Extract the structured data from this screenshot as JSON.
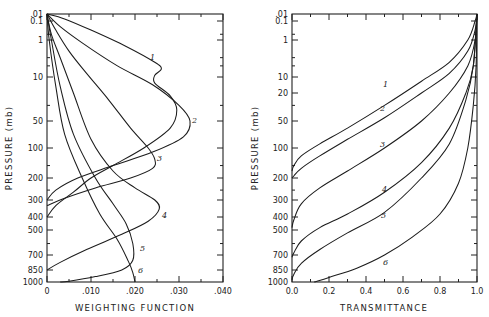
{
  "chart_data": [
    {
      "type": "line",
      "title": "",
      "xlabel": "WEIGHTING FUNCTION",
      "ylabel": "PRESSURE (mb)",
      "xlim": [
        0,
        0.04
      ],
      "ylim": [
        1000,
        0.01
      ],
      "xticks": [
        "0",
        ".010",
        ".020",
        ".030",
        ".040"
      ],
      "yticks": [
        ".01",
        "0.1",
        "1",
        "10",
        "50",
        "100",
        "200",
        "300",
        "400",
        "500",
        "700",
        "850",
        "1000"
      ],
      "grid": false,
      "series": [
        {
          "name": "1",
          "points": [
            [
              0,
              0.01
            ],
            [
              0.004,
              0.05
            ],
            [
              0.01,
              0.3
            ],
            [
              0.018,
              1.5
            ],
            [
              0.0245,
              4
            ],
            [
              0.026,
              6
            ],
            [
              0.0245,
              9
            ],
            [
              0.0245,
              13
            ],
            [
              0.028,
              22
            ],
            [
              0.0295,
              35
            ],
            [
              0.028,
              60
            ],
            [
              0.022,
              100
            ],
            [
              0.015,
              150
            ],
            [
              0.01,
              200
            ],
            [
              0.006,
              260
            ],
            [
              0.002,
              330
            ],
            [
              0,
              400
            ]
          ]
        },
        {
          "name": "2",
          "points": [
            [
              0,
              0.01
            ],
            [
              0.003,
              0.2
            ],
            [
              0.008,
              1.2
            ],
            [
              0.016,
              5
            ],
            [
              0.024,
              14
            ],
            [
              0.03,
              30
            ],
            [
              0.0325,
              50
            ],
            [
              0.031,
              75
            ],
            [
              0.024,
              110
            ],
            [
              0.015,
              150
            ],
            [
              0.007,
              200
            ],
            [
              0.002,
              250
            ],
            [
              0,
              300
            ]
          ]
        },
        {
          "name": "3",
          "points": [
            [
              0,
              0.01
            ],
            [
              0.002,
              0.3
            ],
            [
              0.005,
              2
            ],
            [
              0.009,
              8
            ],
            [
              0.014,
              25
            ],
            [
              0.019,
              60
            ],
            [
              0.023,
              100
            ],
            [
              0.0245,
              130
            ],
            [
              0.024,
              160
            ],
            [
              0.019,
              200
            ],
            [
              0.011,
              240
            ],
            [
              0.004,
              290
            ],
            [
              0,
              330
            ]
          ]
        },
        {
          "name": "4",
          "points": [
            [
              0,
              0.01
            ],
            [
              0.001,
              0.5
            ],
            [
              0.003,
              3
            ],
            [
              0.006,
              20
            ],
            [
              0.01,
              80
            ],
            [
              0.015,
              170
            ],
            [
              0.02,
              240
            ],
            [
              0.0245,
              300
            ],
            [
              0.0255,
              350
            ],
            [
              0.023,
              430
            ],
            [
              0.017,
              530
            ],
            [
              0.009,
              650
            ],
            [
              0.003,
              770
            ],
            [
              0,
              850
            ]
          ]
        },
        {
          "name": "5",
          "points": [
            [
              0,
              0.01
            ],
            [
              0.001,
              1
            ],
            [
              0.003,
              15
            ],
            [
              0.006,
              70
            ],
            [
              0.011,
              200
            ],
            [
              0.015,
              320
            ],
            [
              0.018,
              450
            ],
            [
              0.0195,
              600
            ],
            [
              0.0195,
              750
            ],
            [
              0.017,
              850
            ],
            [
              0.011,
              930
            ],
            [
              0.005,
              990
            ],
            [
              0.003,
              1000
            ]
          ]
        },
        {
          "name": "6",
          "points": [
            [
              0,
              0.01
            ],
            [
              0.0005,
              1
            ],
            [
              0.002,
              15
            ],
            [
              0.004,
              70
            ],
            [
              0.008,
              200
            ],
            [
              0.012,
              380
            ],
            [
              0.016,
              570
            ],
            [
              0.0185,
              760
            ],
            [
              0.0195,
              880
            ],
            [
              0.02,
              1000
            ]
          ]
        }
      ]
    },
    {
      "type": "line",
      "title": "",
      "xlabel": "TRANSMITTANCE",
      "ylabel": "PRESSURE (mb)",
      "xlim": [
        0.0,
        1.0
      ],
      "ylim": [
        1000,
        0.01
      ],
      "xticks": [
        "0.0",
        "0.2",
        "0.4",
        "0.6",
        "0.8",
        "1.0"
      ],
      "yticks": [
        ".01",
        "0.1",
        "1",
        "10",
        "20",
        "50",
        "100",
        "200",
        "300",
        "400",
        "500",
        "700",
        "850",
        "1000"
      ],
      "grid": false,
      "series": [
        {
          "name": "1",
          "points": [
            [
              1.0,
              0.01
            ],
            [
              0.99,
              0.1
            ],
            [
              0.95,
              1
            ],
            [
              0.85,
              4
            ],
            [
              0.7,
              12
            ],
            [
              0.5,
              30
            ],
            [
              0.3,
              60
            ],
            [
              0.15,
              90
            ],
            [
              0.05,
              120
            ],
            [
              0.01,
              150
            ],
            [
              0.0,
              170
            ]
          ]
        },
        {
          "name": "2",
          "points": [
            [
              1.0,
              0.01
            ],
            [
              0.99,
              0.3
            ],
            [
              0.95,
              2
            ],
            [
              0.85,
              8
            ],
            [
              0.7,
              20
            ],
            [
              0.5,
              45
            ],
            [
              0.3,
              80
            ],
            [
              0.15,
              120
            ],
            [
              0.05,
              160
            ],
            [
              0.01,
              190
            ],
            [
              0.0,
              200
            ]
          ]
        },
        {
          "name": "3",
          "points": [
            [
              1.0,
              0.01
            ],
            [
              0.99,
              1
            ],
            [
              0.95,
              5
            ],
            [
              0.85,
              20
            ],
            [
              0.7,
              50
            ],
            [
              0.5,
              100
            ],
            [
              0.3,
              170
            ],
            [
              0.15,
              240
            ],
            [
              0.05,
              320
            ],
            [
              0.01,
              420
            ],
            [
              0.0,
              480
            ]
          ]
        },
        {
          "name": "4",
          "points": [
            [
              1.0,
              0.01
            ],
            [
              0.98,
              5
            ],
            [
              0.94,
              20
            ],
            [
              0.85,
              60
            ],
            [
              0.7,
              140
            ],
            [
              0.5,
              260
            ],
            [
              0.3,
              380
            ],
            [
              0.15,
              480
            ],
            [
              0.05,
              580
            ],
            [
              0.01,
              680
            ],
            [
              0.0,
              720
            ]
          ]
        },
        {
          "name": "5",
          "points": [
            [
              1.0,
              0.01
            ],
            [
              0.98,
              5
            ],
            [
              0.94,
              25
            ],
            [
              0.85,
              90
            ],
            [
              0.7,
              200
            ],
            [
              0.5,
              370
            ],
            [
              0.3,
              520
            ],
            [
              0.15,
              650
            ],
            [
              0.05,
              780
            ],
            [
              0.01,
              900
            ],
            [
              0.0,
              970
            ]
          ]
        },
        {
          "name": "6",
          "points": [
            [
              1.0,
              0.01
            ],
            [
              0.995,
              5
            ],
            [
              0.98,
              30
            ],
            [
              0.95,
              100
            ],
            [
              0.9,
              220
            ],
            [
              0.8,
              380
            ],
            [
              0.65,
              550
            ],
            [
              0.5,
              700
            ],
            [
              0.35,
              830
            ],
            [
              0.2,
              940
            ],
            [
              0.12,
              1000
            ]
          ]
        }
      ]
    }
  ],
  "left_plot": {
    "xlabel": "WEIGHTING FUNCTION",
    "ylabel": "PRESSURE (mb)",
    "xticks": [
      {
        "label": "0",
        "v": 0
      },
      {
        "label": ".010",
        "v": 0.01
      },
      {
        "label": ".020",
        "v": 0.02
      },
      {
        "label": ".030",
        "v": 0.03
      },
      {
        "label": ".040",
        "v": 0.04
      }
    ],
    "curve_labels": [
      {
        "text": "1",
        "x": 150,
        "y": 60
      },
      {
        "text": "2",
        "x": 192,
        "y": 123
      },
      {
        "text": "3",
        "x": 157,
        "y": 161
      },
      {
        "text": "4",
        "x": 162,
        "y": 218
      },
      {
        "text": "5",
        "x": 140,
        "y": 251
      },
      {
        "text": "6",
        "x": 138,
        "y": 273
      }
    ]
  },
  "right_plot": {
    "xlabel": "TRANSMITTANCE",
    "ylabel": "PRESSURE (mb)",
    "xticks": [
      {
        "label": "0.0",
        "v": 0.0
      },
      {
        "label": "0.2",
        "v": 0.2
      },
      {
        "label": "0.4",
        "v": 0.4
      },
      {
        "label": "0.6",
        "v": 0.6
      },
      {
        "label": "0.8",
        "v": 0.8
      },
      {
        "label": "1.0",
        "v": 1.0
      }
    ],
    "curve_labels": [
      {
        "text": "1",
        "x": 383,
        "y": 87
      },
      {
        "text": "2",
        "x": 380,
        "y": 111
      },
      {
        "text": "3",
        "x": 380,
        "y": 147
      },
      {
        "text": "4",
        "x": 382,
        "y": 192
      },
      {
        "text": "5",
        "x": 381,
        "y": 218
      },
      {
        "text": "6",
        "x": 383,
        "y": 265
      }
    ]
  },
  "y_ticks_left": [
    {
      "label": ".01",
      "p": 0.01
    },
    {
      "label": "0.1",
      "p": 0.1
    },
    {
      "label": "1",
      "p": 1
    },
    {
      "label": "10",
      "p": 10
    },
    {
      "label": "50",
      "p": 50
    },
    {
      "label": "100",
      "p": 100
    },
    {
      "label": "200",
      "p": 200
    },
    {
      "label": "300",
      "p": 300
    },
    {
      "label": "400",
      "p": 400
    },
    {
      "label": "500",
      "p": 500
    },
    {
      "label": "700",
      "p": 700
    },
    {
      "label": "850",
      "p": 850
    },
    {
      "label": "1000",
      "p": 1000
    }
  ],
  "y_ticks_right": [
    {
      "label": ".01",
      "p": 0.01
    },
    {
      "label": "0.1",
      "p": 0.1
    },
    {
      "label": "1",
      "p": 1
    },
    {
      "label": "10",
      "p": 10
    },
    {
      "label": "20",
      "p": 20
    },
    {
      "label": "50",
      "p": 50
    },
    {
      "label": "100",
      "p": 100
    },
    {
      "label": "200",
      "p": 200
    },
    {
      "label": "300",
      "p": 300
    },
    {
      "label": "400",
      "p": 400
    },
    {
      "label": "500",
      "p": 500
    },
    {
      "label": "700",
      "p": 700
    },
    {
      "label": "850",
      "p": 850
    },
    {
      "label": "1000",
      "p": 1000
    }
  ],
  "y_minor_ticks": [
    0.5,
    3,
    5,
    30,
    150,
    250,
    600
  ]
}
